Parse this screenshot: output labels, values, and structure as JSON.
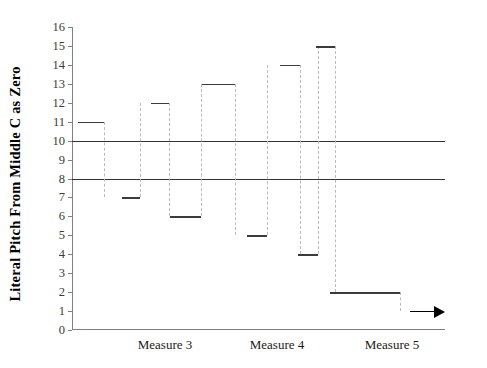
{
  "chart_data": {
    "type": "line",
    "title": "",
    "xlabel": "",
    "ylabel": "Literal Pitch From Middle C as Zero",
    "ylim": [
      0,
      16
    ],
    "yticks": [
      0,
      1,
      2,
      3,
      4,
      5,
      6,
      7,
      8,
      9,
      10,
      11,
      12,
      13,
      14,
      15,
      16
    ],
    "ytick_labels": [
      "0",
      "1",
      "2",
      "3",
      "4",
      "5",
      "6",
      "7",
      "8",
      "9",
      "10",
      "11",
      "12",
      "13",
      "14",
      "15",
      "16"
    ],
    "categories": [
      "Measure 3",
      "Measure 4",
      "Measure 5"
    ],
    "grid": false,
    "legend": false,
    "reference_lines": [
      {
        "value": 10,
        "style": "solid",
        "color": "#333333"
      },
      {
        "value": 8,
        "style": "solid",
        "color": "#333333"
      }
    ],
    "notes": [
      {
        "index": 1,
        "pitch": 11,
        "x_start": 6,
        "x_end": 32
      },
      {
        "index": 2,
        "pitch": 7,
        "x_start": 50,
        "x_end": 68
      },
      {
        "index": 3,
        "pitch": 12,
        "x_start": 79,
        "x_end": 97
      },
      {
        "index": 4,
        "pitch": 6,
        "x_start": 98,
        "x_end": 129
      },
      {
        "index": 5,
        "pitch": 13,
        "x_start": 130,
        "x_end": 163
      },
      {
        "index": 6,
        "pitch": 5,
        "x_start": 175,
        "x_end": 195
      },
      {
        "index": 7,
        "pitch": 14,
        "x_start": 208,
        "x_end": 228
      },
      {
        "index": 8,
        "pitch": 4,
        "x_start": 226,
        "x_end": 246
      },
      {
        "index": 9,
        "pitch": 15,
        "x_start": 244,
        "x_end": 263
      },
      {
        "index": 10,
        "pitch": 2,
        "x_start": 258,
        "x_end": 328
      },
      {
        "index": 11,
        "pitch": 1,
        "x_start": 338,
        "x_end": 373,
        "arrow": true
      }
    ],
    "connectors": [
      {
        "x": 32,
        "from": 11,
        "to": 7
      },
      {
        "x": 68,
        "from": 7,
        "to": 12
      },
      {
        "x": 97,
        "from": 12,
        "to": 6
      },
      {
        "x": 129,
        "from": 6,
        "to": 13
      },
      {
        "x": 163,
        "from": 13,
        "to": 5
      },
      {
        "x": 195,
        "from": 5,
        "to": 14
      },
      {
        "x": 228,
        "from": 14,
        "to": 4
      },
      {
        "x": 246,
        "from": 4,
        "to": 15
      },
      {
        "x": 263,
        "from": 15,
        "to": 2
      },
      {
        "x": 328,
        "from": 2,
        "to": 1
      }
    ],
    "measure_label_x": [
      93,
      205,
      320
    ]
  }
}
